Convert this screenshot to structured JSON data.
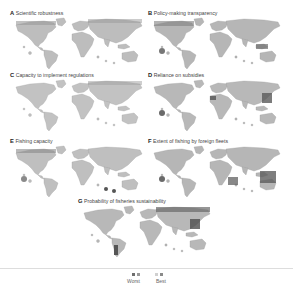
{
  "panels": [
    {
      "letter": "A",
      "title": "Scientific robustness",
      "shade": "#b9b9b9",
      "dark": "#8f8f8f"
    },
    {
      "letter": "B",
      "title": "Policy-making transparency",
      "shade": "#b4b4b4",
      "dark": "#7d7d7d"
    },
    {
      "letter": "C",
      "title": "Capacity to implement regulations",
      "shade": "#c0c0c0",
      "dark": "#8e8e8e"
    },
    {
      "letter": "D",
      "title": "Reliance on subsidies",
      "shade": "#b8b8b8",
      "dark": "#6a6a6a"
    },
    {
      "letter": "E",
      "title": "Fishing capacity",
      "shade": "#bdbdbd",
      "dark": "#7f7f7f"
    },
    {
      "letter": "F",
      "title": "Extent of fishing by foreign fleets",
      "shade": "#b6b6b6",
      "dark": "#666666"
    },
    {
      "letter": "G",
      "title": "Probability of fisheries sustainability",
      "shade": "#b8b8b8",
      "dark": "#5e5e5e"
    }
  ],
  "legend": {
    "worst_label": "Worst",
    "best_label": "Best",
    "colors": [
      "#6e6e6e",
      "#9a9a9a",
      "#c8c8c8",
      "#8a8a8a"
    ]
  }
}
